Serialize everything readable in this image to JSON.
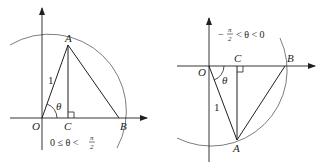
{
  "figures": [
    {
      "id": "left",
      "labels": {
        "origin": "O",
        "point_a": "A",
        "point_b": "B",
        "point_c": "C",
        "side": "1",
        "angle": "θ"
      },
      "condition": {
        "prefix": "0 ≤ θ <",
        "frac_num": "π",
        "frac_den": "2"
      }
    },
    {
      "id": "right",
      "labels": {
        "origin": "O",
        "point_a": "A",
        "point_b": "B",
        "point_c": "C",
        "side": "1",
        "angle": "θ"
      },
      "condition": {
        "minus": "−",
        "frac_num": "π",
        "frac_den": "2",
        "suffix": "< θ < 0"
      }
    }
  ],
  "colors": {
    "ink": "#231f20",
    "arc": "#6d6e71"
  }
}
